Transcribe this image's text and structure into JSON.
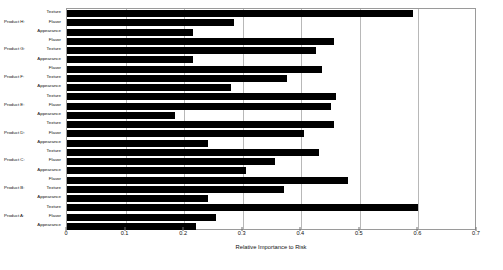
{
  "chart_data": {
    "type": "bar",
    "orientation": "horizontal",
    "title": "",
    "xlabel": "Relative Importance to Risk",
    "ylabel": "",
    "xlim": [
      0,
      0.7
    ],
    "xticks": [
      0,
      0.1,
      0.2,
      0.3,
      0.4,
      0.5,
      0.6,
      0.7
    ],
    "xtick_labels": [
      "0",
      "0.1",
      "0.2",
      "0.3",
      "0.4",
      "0.5",
      "0.6",
      "0.7"
    ],
    "grid": true,
    "grid_axis": "x",
    "legend": "none",
    "bar_color": "#000000",
    "groups": [
      {
        "group": "Product H",
        "categories": [
          "Texture",
          "Flavor",
          "Appearance"
        ],
        "values": [
          0.59,
          0.285,
          0.215
        ]
      },
      {
        "group": "Product G",
        "categories": [
          "Flavor",
          "Texture",
          "Appearance"
        ],
        "values": [
          0.455,
          0.425,
          0.215
        ]
      },
      {
        "group": "Product F",
        "categories": [
          "Flavor",
          "Texture",
          "Appearance"
        ],
        "values": [
          0.435,
          0.375,
          0.28
        ]
      },
      {
        "group": "Product E",
        "categories": [
          "Texture",
          "Flavor",
          "Appearance"
        ],
        "values": [
          0.46,
          0.45,
          0.185
        ]
      },
      {
        "group": "Product D",
        "categories": [
          "Texture",
          "Flavor",
          "Appearance"
        ],
        "values": [
          0.455,
          0.405,
          0.24
        ]
      },
      {
        "group": "Product C",
        "categories": [
          "Texture",
          "Flavor",
          "Appearance"
        ],
        "values": [
          0.43,
          0.355,
          0.305
        ]
      },
      {
        "group": "Product B",
        "categories": [
          "Flavor",
          "Texture",
          "Appearance"
        ],
        "values": [
          0.48,
          0.37,
          0.24
        ]
      },
      {
        "group": "Product A",
        "categories": [
          "Texture",
          "Flavor",
          "Appearance"
        ],
        "values": [
          0.6,
          0.255,
          0.22
        ]
      }
    ]
  }
}
